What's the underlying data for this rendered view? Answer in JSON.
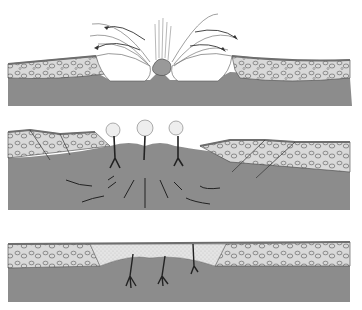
{
  "diagram": {
    "type": "geological cross-section sequence",
    "panel_count": 3,
    "colors": {
      "background": "#ffffff",
      "bedrock": "#8c8c8c",
      "conglomerate_fill": "#d9d9d9",
      "conglomerate_outline": "#555555",
      "crust_top": "#6e6e6e",
      "sand_fill": "#e4e4e4",
      "arrows": "#333333",
      "crater_void": "#ffffff",
      "flow_lines": "#888888"
    },
    "panels": [
      {
        "id": "panel-1",
        "description": "eruption / ejection with debris arcs, central blob, and twin cavities"
      },
      {
        "id": "panel-2",
        "description": "three plumes rising from feeders with converging subsurface flow arrows and faulted layers"
      },
      {
        "id": "panel-3",
        "description": "basin filled with fine sediment, three dendritic feeders below"
      }
    ]
  }
}
